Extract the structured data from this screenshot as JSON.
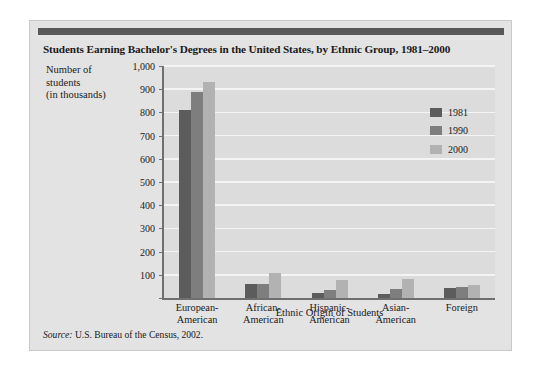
{
  "figure": {
    "title": "Students Earning Bachelor's Degrees in the United States, by Ethnic Group, 1981–2000",
    "source_prefix": "Source:",
    "source_text": "U.S. Bureau of the Census, 2002.",
    "axis_label_block": "Number of\nstudents\n(in thousands)"
  },
  "colors": {
    "series_1981": "#5c5c5c",
    "series_1990": "#7e7e7e",
    "series_2000": "#b2b2b2",
    "panel_background": "#e3e3e3",
    "plot_background": "#dcdcdc",
    "gridline": "#f4f4f4",
    "axis": "#6f6f6f",
    "top_bar": "#585858",
    "text": "#1a1a1a"
  },
  "chart_data": {
    "type": "bar",
    "title": "Students Earning Bachelor's Degrees in the United States, by Ethnic Group, 1981–2000",
    "subtitle": "",
    "xlabel": "Ethnic Origin of Students",
    "ylabel": "Number of students (in thousands)",
    "categories": [
      "European-American",
      "African-American",
      "Hispanic-American",
      "Asian-American",
      "Foreign"
    ],
    "category_lines": [
      [
        "European-",
        "American"
      ],
      [
        "African-",
        "American"
      ],
      [
        "Hispanic-",
        "American"
      ],
      [
        "Asian-",
        "American"
      ],
      [
        "Foreign",
        ""
      ]
    ],
    "series": [
      {
        "name": "1981",
        "color": "#5c5c5c",
        "values": [
          810,
          60,
          22,
          18,
          45
        ]
      },
      {
        "name": "1990",
        "color": "#7e7e7e",
        "values": [
          890,
          61,
          33,
          40,
          47
        ]
      },
      {
        "name": "2000",
        "color": "#b2b2b2",
        "values": [
          930,
          108,
          78,
          82,
          55
        ]
      }
    ],
    "ylim": [
      0,
      1000
    ],
    "ytick_values": [
      0,
      100,
      200,
      300,
      400,
      500,
      600,
      700,
      800,
      900,
      1000
    ],
    "ytick_labels": [
      "",
      "100",
      "200",
      "300",
      "400",
      "500",
      "600",
      "700",
      "800",
      "900",
      "1,000"
    ],
    "grid": true,
    "legend_position": "upper right",
    "legend_entries": [
      "1981",
      "1990",
      "2000"
    ],
    "source": "Source: U.S. Bureau of the Census, 2002."
  }
}
